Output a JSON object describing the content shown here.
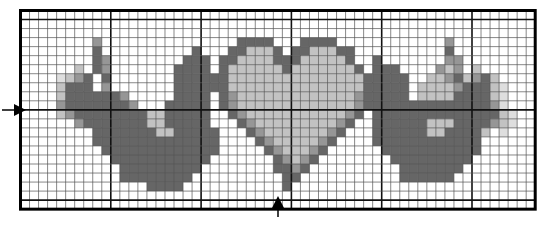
{
  "legend": {
    "D": {
      "name": "dark gray",
      "color": "#666666"
    },
    "M": {
      "name": "medium gray",
      "color": "#969696"
    },
    "L": {
      "name": "light gray",
      "color": "#c2c2c2"
    },
    "P": {
      "name": "pale gray",
      "color": "#dedede"
    }
  },
  "grid": {
    "cols": 57,
    "rows": 22,
    "major_every": 10,
    "major_offset_cols": 0,
    "major_offset_rows": 1
  },
  "center_markers": {
    "horizontal_arrow_row": 11,
    "vertical_arrow_col": 28
  },
  "chart_data": {
    "type": "heatmap",
    "title": "",
    "rows": [
      ".........................................................",
      ".........................................................",
      ".........................................................",
      "........M...............DDDD...DDDD............M.........",
      "........D..........D...DDLLLD.DDLLLDD..........D.........",
      "........DM........DDD.DDLLLLDDDLLLLLD..D.......MM........",
      "......L.DM.......DDDD.DLLLLLLDLLLLLLLD.DDD....MLM.L......",
      "....PLMD.D.......DDDDDDLLLLLLLLLLLLLLLDDDDD..LLMDLMDL.....",
      "....LDDD.M.......DDDDDDLLLLLLLLLLLLLLLDDDDD.LLLLMDDDLP....",
      "....LDDDDDDM.....DDDD.DMLLLLLLLLLLLLLMDDDDD.LLLLDDDDLP....",
      "....MDDDDDDDM...DDDDD.DMLLLLLLLLLLLLLMDDDDDDDDDDDDDDMP....",
      "....LMDDDDDDDDLLDDDDD..DMLLLLLLLLLLLMD.DDDDDDDDDDDDDDLP...",
      "......MDDDDDDDLLDDDDD...DMLLLLLLLLLMD..DDDDDDLLLDDDDMLP...",
      "........DDDDDDDLLDDDDD...DMLLLLLLLMD...DDDDDDLLDDDDL.P....",
      "........DDDDDDDDDDDDDD....DMLLLLLMD....DDDDDDDDDDDD.......",
      ".........DDDDDDDDDDDDD.....DMLLLMD......DDDDDDDDDDD.......",
      "..........DDDDDDDDDDD.......DMLMD........DDDDDDDDD........",
      "...........DDDDDDDDD........DDMD..........DDDDDDD.........",
      "...........DDDDDDDD..........DD...........DDDDDD..........",
      "..............DDDD...........D.........................",
      ".........................................................",
      "........................................................."
    ]
  }
}
